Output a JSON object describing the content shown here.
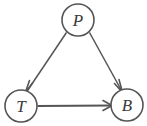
{
  "diagram": {
    "type": "directed-graph",
    "title": "",
    "background_color": "#ffffff",
    "stroke_color": "#555555",
    "label_color": "#3a3a3a",
    "nodes": [
      {
        "id": "P",
        "label": "P",
        "cx": 78,
        "cy": 20,
        "r": 16,
        "name": "node-p"
      },
      {
        "id": "T",
        "label": "T",
        "cx": 21,
        "cy": 106,
        "r": 16,
        "name": "node-t"
      },
      {
        "id": "B",
        "label": "B",
        "cx": 127,
        "cy": 105,
        "r": 16,
        "name": "node-b"
      }
    ],
    "edges": [
      {
        "id": "P-T",
        "from": "P",
        "to": "T",
        "label": "",
        "directed": true,
        "name": "edge-p-to-t"
      },
      {
        "id": "P-B",
        "from": "P",
        "to": "B",
        "label": "",
        "directed": true,
        "name": "edge-p-to-b"
      },
      {
        "id": "T-B",
        "from": "T",
        "to": "B",
        "label": "",
        "directed": true,
        "name": "edge-t-to-b"
      }
    ]
  }
}
